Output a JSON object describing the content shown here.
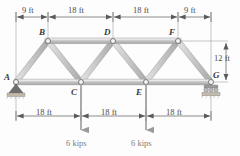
{
  "figure": {
    "type": "truss-free-body-diagram"
  },
  "joints": [
    {
      "id": "A",
      "label": "A",
      "x": 16,
      "y": 82,
      "chord": "bottom",
      "support": "pin"
    },
    {
      "id": "B",
      "label": "B",
      "x": 48,
      "y": 41,
      "chord": "top",
      "support": "none"
    },
    {
      "id": "C",
      "label": "C",
      "x": 81,
      "y": 82,
      "chord": "bottom",
      "support": "none"
    },
    {
      "id": "D",
      "label": "D",
      "x": 113,
      "y": 41,
      "chord": "top",
      "support": "none"
    },
    {
      "id": "E",
      "label": "E",
      "x": 146,
      "y": 82,
      "chord": "bottom",
      "support": "none"
    },
    {
      "id": "F",
      "label": "F",
      "x": 178,
      "y": 41,
      "chord": "top",
      "support": "none"
    },
    {
      "id": "G",
      "label": "G",
      "x": 211,
      "y": 82,
      "chord": "bottom",
      "support": "roller"
    }
  ],
  "members": [
    {
      "from": "A",
      "to": "B"
    },
    {
      "from": "B",
      "to": "D"
    },
    {
      "from": "D",
      "to": "F"
    },
    {
      "from": "F",
      "to": "G"
    },
    {
      "from": "A",
      "to": "C"
    },
    {
      "from": "C",
      "to": "E"
    },
    {
      "from": "E",
      "to": "G"
    },
    {
      "from": "B",
      "to": "C"
    },
    {
      "from": "C",
      "to": "D"
    },
    {
      "from": "D",
      "to": "E"
    },
    {
      "from": "E",
      "to": "F"
    }
  ],
  "supports": {
    "pin": {
      "at": "A",
      "label": "pin-support"
    },
    "roller": {
      "at": "G",
      "label": "roller-support"
    }
  },
  "dimensions": {
    "top": [
      {
        "text": "9 ft",
        "from_x": 16,
        "to_x": 48
      },
      {
        "text": "18 ft",
        "from_x": 48,
        "to_x": 113
      },
      {
        "text": "18 ft",
        "from_x": 113,
        "to_x": 178
      },
      {
        "text": "9 ft",
        "from_x": 178,
        "to_x": 211
      }
    ],
    "bottom": [
      {
        "text": "18 ft",
        "from_x": 16,
        "to_x": 81
      },
      {
        "text": "18 ft",
        "from_x": 81,
        "to_x": 146
      },
      {
        "text": "18 ft",
        "from_x": 146,
        "to_x": 211
      }
    ],
    "vertical": {
      "text": "12 ft",
      "from_y": 41,
      "to_y": 82
    }
  },
  "loads": [
    {
      "at": "C",
      "text": "6 kips",
      "direction": "down",
      "magnitude": 6,
      "unit": "kips"
    },
    {
      "at": "E",
      "text": "6 kips",
      "direction": "down",
      "magnitude": 6,
      "unit": "kips"
    }
  ],
  "colors": {
    "member_fill": "#c9c9c9",
    "member_light": "#e8e8e8",
    "member_dark": "#9a9a9a",
    "line": "#5a5a5a",
    "label": "#3a3a3a",
    "load": "#8a8a8a",
    "background": "#fdfdfd"
  }
}
